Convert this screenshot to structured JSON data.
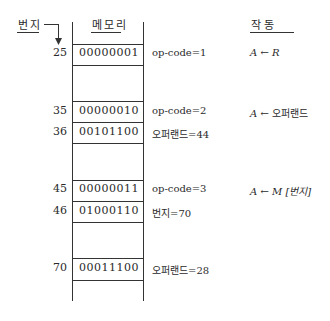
{
  "headers": {
    "address": "번지",
    "memory": "메모리",
    "action": "작   동"
  },
  "rows": [
    {
      "address": "25",
      "value": "00000001",
      "description": "op-code=1",
      "action_reg": "A",
      "action_arrow": "←",
      "action_src": "R"
    },
    {
      "address": "35",
      "value": "00000010",
      "description": "op-code=2",
      "action_reg": "A",
      "action_arrow": "←",
      "action_src": "오퍼랜드"
    },
    {
      "address": "36",
      "value": "00101100",
      "description": "오퍼랜드=44",
      "action_reg": "",
      "action_arrow": "",
      "action_src": ""
    },
    {
      "address": "45",
      "value": "00000011",
      "description": "op-code=3",
      "action_reg": "A",
      "action_arrow": "←",
      "action_src": "M [번지]"
    },
    {
      "address": "46",
      "value": "01000110",
      "description": "번지=70",
      "action_reg": "",
      "action_arrow": "",
      "action_src": ""
    },
    {
      "address": "70",
      "value": "00011100",
      "description": "오퍼랜드=28",
      "action_reg": "",
      "action_arrow": "",
      "action_src": ""
    }
  ],
  "colors": {
    "line": "#333333",
    "text": "#2a2a2a",
    "background": "#ffffff"
  }
}
